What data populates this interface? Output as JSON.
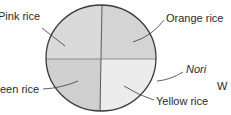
{
  "diagram": {
    "type": "sushi-roll-cross-section",
    "quadrants": [
      {
        "id": "top-left",
        "label": "Pink rice",
        "fill": "#dadada"
      },
      {
        "id": "top-right",
        "label": "Orange rice",
        "fill": "#d4d4d4"
      },
      {
        "id": "bottom-left",
        "label": "Green rice",
        "fill": "#cfcfcf"
      },
      {
        "id": "bottom-right",
        "label": "Yellow rice",
        "fill": "#ececec"
      }
    ],
    "outer_layer": {
      "label": "Nori"
    },
    "line_color": "#4a4a4a"
  },
  "labels": {
    "pink": "Pink rice",
    "orange": "Orange rice",
    "green": "een rice",
    "yellow": "Yellow rice",
    "nori": "Nori",
    "partial_right": "W"
  }
}
